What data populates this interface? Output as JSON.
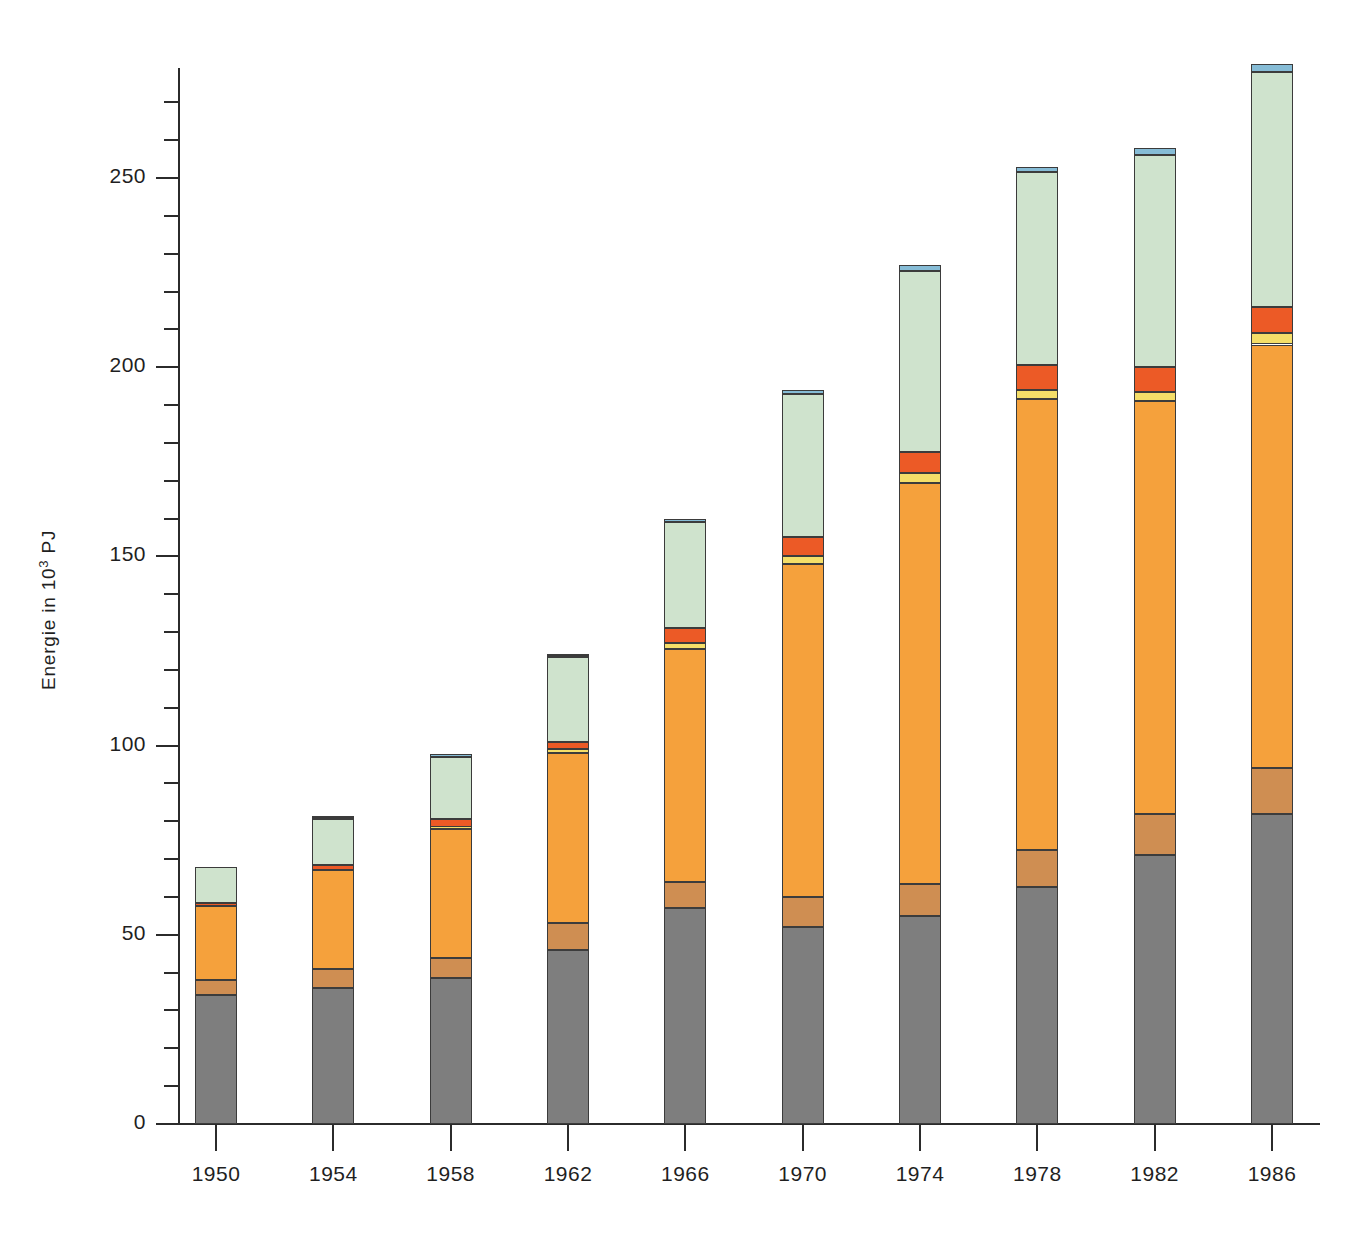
{
  "chart_data": {
    "type": "bar",
    "subtype": "stacked-vertical",
    "title": "",
    "xlabel": "",
    "ylabel": "Energie in 10³ PJ",
    "ylabel_base": "Energie in 10",
    "ylabel_exponent": "3",
    "ylabel_unit": "PJ",
    "categories": [
      "1950",
      "1954",
      "1958",
      "1962",
      "1966",
      "1970",
      "1974",
      "1978",
      "1982",
      "1986"
    ],
    "ylim": [
      0,
      280
    ],
    "y_major_ticks": [
      0,
      50,
      100,
      150,
      200,
      250
    ],
    "y_major_tick_labels": [
      "0",
      "50",
      "100",
      "150",
      "200",
      "250"
    ],
    "y_minor_tick_interval": 10,
    "grid": false,
    "legend": "none",
    "series": [
      {
        "name": "steinkohle",
        "color": "#7e7e7e",
        "values": [
          34,
          36,
          38.5,
          46,
          57,
          52,
          55,
          62.5,
          71,
          82
        ]
      },
      {
        "name": "braunkohle",
        "color": "#cf8e52",
        "values": [
          4,
          5,
          5.5,
          7,
          7,
          8,
          8.5,
          10,
          11,
          12
        ]
      },
      {
        "name": "mineraloel",
        "color": "#f5a13c",
        "values": [
          19.5,
          26,
          34,
          45,
          61.5,
          88,
          106,
          119,
          109,
          112
        ]
      },
      {
        "name": "erdgas",
        "color": "#f5de68",
        "values": [
          0,
          0,
          0.5,
          1,
          1.5,
          2,
          2.5,
          2.5,
          2.5,
          3
        ]
      },
      {
        "name": "kernenergie",
        "color": "#ec5a26",
        "values": [
          1,
          1.5,
          2,
          2,
          4,
          5,
          5.5,
          6.5,
          6.5,
          7
        ]
      },
      {
        "name": "wasserkraft-sonstige",
        "color": "#cfe3cd",
        "values": [
          9.5,
          12,
          16.5,
          22.5,
          28,
          38,
          48,
          51,
          56,
          62
        ]
      },
      {
        "name": "aussenhandelssaldo",
        "color": "#86bcd6",
        "values": [
          0,
          0.5,
          0.5,
          0.5,
          1,
          1,
          1.5,
          1.5,
          2,
          2
        ]
      }
    ],
    "totals": [
      68,
      81,
      97,
      124,
      160,
      194,
      227,
      253,
      258,
      280
    ]
  },
  "colors": {
    "axis": "#2b2b2b",
    "text": "#1f1f1f",
    "background": "#ffffff",
    "bar_border": "#3b3b3b"
  }
}
